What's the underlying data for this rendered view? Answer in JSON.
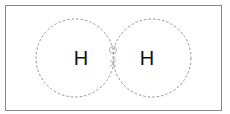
{
  "diagram": {
    "title": "",
    "atoms": [
      {
        "label": "H",
        "cx": 75,
        "cy": 58,
        "r": 39
      },
      {
        "label": "H",
        "cx": 152,
        "cy": 58,
        "r": 39
      }
    ],
    "shared_electrons": [
      {
        "symbol": "o",
        "color": "#aaaaaa"
      },
      {
        "symbol": "x",
        "color": "#aaaaaa"
      }
    ],
    "colors": {
      "border": "#888888",
      "circle": "#888888",
      "label": "#111111"
    }
  }
}
